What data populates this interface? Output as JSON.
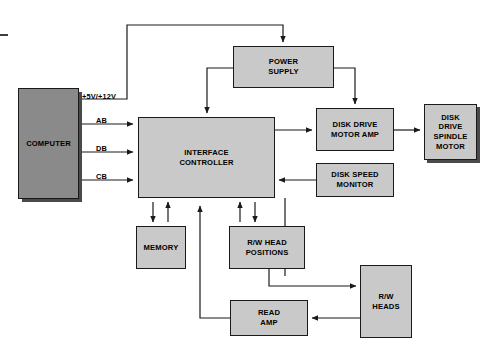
{
  "diagram": {
    "colors": {
      "block_fill_light": "#c9c9c9",
      "block_fill_dark": "#8a8a8a",
      "stroke": "#1a1a1a",
      "background": "#ffffff"
    },
    "blocks": [
      {
        "id": "computer",
        "label": "COMPUTER",
        "shade": "dark"
      },
      {
        "id": "interface",
        "label": "INTERFACE\nCONTROLLER",
        "shade": "light"
      },
      {
        "id": "power-supply",
        "label": "POWER\nSUPPLY",
        "shade": "light"
      },
      {
        "id": "motor-amp",
        "label": "DISK DRIVE\nMOTOR AMP",
        "shade": "light"
      },
      {
        "id": "spindle-motor",
        "label": "DISK\nDRIVE\nSPINDLE\nMOTOR",
        "shade": "light"
      },
      {
        "id": "speed-monitor",
        "label": "DISK SPEED\nMONITOR",
        "shade": "light"
      },
      {
        "id": "memory",
        "label": "MEMORY",
        "shade": "light"
      },
      {
        "id": "head-positions",
        "label": "R/W HEAD\nPOSITIONS",
        "shade": "light"
      },
      {
        "id": "rw-heads",
        "label": "R/W\nHEADS",
        "shade": "light"
      },
      {
        "id": "read-amp",
        "label": "READ\nAMP",
        "shade": "light"
      }
    ],
    "wire_labels": [
      {
        "id": "power-rail",
        "text": "+5V/+12V"
      },
      {
        "id": "address-bus",
        "text": "AB"
      },
      {
        "id": "data-bus",
        "text": "DB"
      },
      {
        "id": "control-bus",
        "text": "CB"
      }
    ]
  }
}
